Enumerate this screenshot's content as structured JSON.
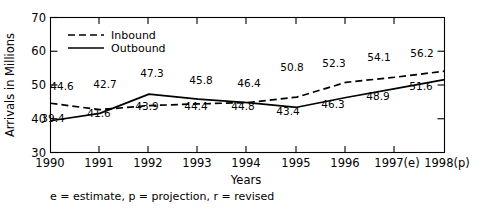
{
  "chart_data": {
    "type": "line",
    "title": "",
    "xlabel": "Years",
    "ylabel": "Arrivals in Millions",
    "ylim": [
      30,
      70
    ],
    "yticks": [
      30,
      40,
      50,
      60,
      70
    ],
    "grid": false,
    "legend_position": "top-left",
    "categories": [
      "1990",
      "1991",
      "1992",
      "1993",
      "1994",
      "1995",
      "1996",
      "1997(e)",
      "1998(p)"
    ],
    "series": [
      {
        "name": "Inbound",
        "style": "dashed",
        "values": [
          44.6,
          42.7,
          43.9,
          44.4,
          44.8,
          46.4,
          50.8,
          52.3,
          54.1
        ],
        "labels": [
          "44.6",
          "42.7",
          "43.9",
          "44.4",
          "44.8",
          "46.4",
          "50.8",
          "52.3",
          "54.1"
        ]
      },
      {
        "name": "Outbound",
        "style": "solid",
        "values": [
          39.4,
          41.6,
          47.3,
          45.8,
          44.8,
          43.4,
          46.3,
          48.9,
          51.6
        ],
        "labels": [
          "39.4",
          "41.6",
          "47.3",
          "45.8",
          "44.8",
          "43.4",
          "46.3",
          "48.9",
          "51.6"
        ]
      }
    ],
    "annotations": {
      "footnote": "e = estimate, p = projection, r = revised"
    },
    "point_labels": [
      {
        "text": "44.6",
        "x": 62,
        "y": 90,
        "series": "Inbound"
      },
      {
        "text": "42.7",
        "x": 105,
        "y": 88,
        "series": "Inbound"
      },
      {
        "text": "47.3",
        "x": 152,
        "y": 77,
        "series": "Outbound"
      },
      {
        "text": "45.8",
        "x": 201,
        "y": 84,
        "series": "Outbound"
      },
      {
        "text": "46.4",
        "x": 249,
        "y": 87,
        "series": "Inbound"
      },
      {
        "text": "50.8",
        "x": 292,
        "y": 71,
        "series": "Inbound"
      },
      {
        "text": "52.3",
        "x": 334,
        "y": 67,
        "series": "Inbound"
      },
      {
        "text": "54.1",
        "x": 379,
        "y": 61,
        "series": "Inbound"
      },
      {
        "text": "56.2",
        "x": 422,
        "y": 57,
        "series": "Inbound"
      },
      {
        "text": "39.4",
        "x": 53,
        "y": 122,
        "series": "Outbound"
      },
      {
        "text": "41.6",
        "x": 99,
        "y": 117,
        "series": "Outbound"
      },
      {
        "text": "43.9",
        "x": 147,
        "y": 110,
        "series": "Outbound"
      },
      {
        "text": "44.4",
        "x": 196,
        "y": 110,
        "series": "Outbound"
      },
      {
        "text": "44.8",
        "x": 243,
        "y": 110,
        "series": "Outbound"
      },
      {
        "text": "43.4",
        "x": 288,
        "y": 115,
        "series": "Outbound"
      },
      {
        "text": "46.3",
        "x": 333,
        "y": 108,
        "series": "Outbound"
      },
      {
        "text": "48.9",
        "x": 378,
        "y": 100,
        "series": "Outbound"
      },
      {
        "text": "51.6",
        "x": 421,
        "y": 90,
        "series": "Outbound"
      }
    ]
  },
  "axis": {
    "y_title": "Arrivals in Millions",
    "x_title": "Years",
    "y_ticks": [
      "70",
      "60",
      "50",
      "40",
      "30"
    ],
    "x_ticks": [
      "1990",
      "1991",
      "1992",
      "1993",
      "1994",
      "1995",
      "1996",
      "1997(e)",
      "1998(p)"
    ]
  },
  "legend": {
    "items": [
      {
        "label": "Inbound",
        "style": "dashed"
      },
      {
        "label": "Outbound",
        "style": "solid"
      }
    ]
  },
  "footnote": {
    "text": "e = estimate, p = projection, r = revised"
  }
}
